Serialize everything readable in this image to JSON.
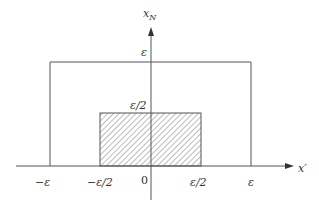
{
  "diagram": {
    "axes": {
      "x_label": "x′",
      "y_label": "x",
      "y_label_sub": "N",
      "origin_label": "0"
    },
    "x_ticks": [
      {
        "label": "−ε"
      },
      {
        "label": "−ε/2"
      },
      {
        "label": "ε/2"
      },
      {
        "label": "ε"
      }
    ],
    "y_ticks": [
      {
        "label": "ε"
      },
      {
        "label": "ε/2"
      }
    ],
    "regions": {
      "outer_rectangle": "[−ε, ε] × [0, ε]",
      "hatched_rectangle": "[−ε/2, ε/2] × [0, ε/2]"
    },
    "colors": {
      "line": "#555555",
      "hatch": "#555555",
      "background": "#ffffff"
    }
  }
}
